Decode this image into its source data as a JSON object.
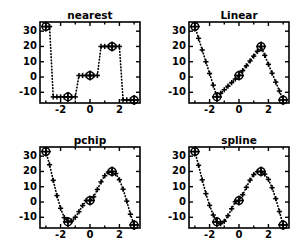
{
  "figure": {
    "width": 300,
    "height": 250,
    "background": "#ffffff",
    "foreground": "#000000",
    "rows": 2,
    "cols": 2
  },
  "chart_data": [
    {
      "type": "line",
      "title": "nearest",
      "xlabel": "",
      "ylabel": "",
      "xlim": [
        -3.4,
        3.4
      ],
      "ylim": [
        -17,
        36
      ],
      "xticks": [
        -2,
        0,
        2
      ],
      "xticklabels": [
        "-2",
        "0",
        "2"
      ],
      "yticks": [
        -10,
        0,
        10,
        20,
        30
      ],
      "yticklabels": [
        "-10",
        "0",
        "10",
        "20",
        "30"
      ],
      "grid": false,
      "legend": null,
      "knots": {
        "name": "sample points",
        "marker": "circle-plus",
        "x": [
          -3,
          -1.5,
          0,
          1.5,
          3
        ],
        "y": [
          33,
          -13,
          1,
          20,
          -15
        ]
      },
      "series": [
        {
          "name": "nearest",
          "marker": "plus",
          "linestyle": "dotted",
          "x": [
            -3,
            -2.75,
            -2.5,
            -2.25,
            -2,
            -1.75,
            -1.5,
            -1.25,
            -1,
            -0.75,
            -0.5,
            -0.25,
            0,
            0.25,
            0.5,
            0.75,
            1,
            1.25,
            1.5,
            1.75,
            2,
            2.25,
            2.5,
            2.75,
            3
          ],
          "y": [
            33,
            33,
            -13,
            -13,
            -13,
            -13,
            -13,
            -13,
            -13,
            1,
            1,
            1,
            1,
            1,
            1,
            20,
            20,
            20,
            20,
            20,
            20,
            -15,
            -15,
            -15,
            -15
          ]
        }
      ]
    },
    {
      "type": "line",
      "title": "Linear",
      "xlabel": "",
      "ylabel": "",
      "xlim": [
        -3.4,
        3.4
      ],
      "ylim": [
        -17,
        36
      ],
      "xticks": [
        -2,
        0,
        2
      ],
      "xticklabels": [
        "-2",
        "0",
        "2"
      ],
      "yticks": [
        -10,
        0,
        10,
        20,
        30
      ],
      "yticklabels": [
        "-10",
        "0",
        "10",
        "20",
        "30"
      ],
      "grid": false,
      "legend": null,
      "knots": {
        "name": "sample points",
        "marker": "circle-plus",
        "x": [
          -3,
          -1.5,
          0,
          1.5,
          3
        ],
        "y": [
          33,
          -13,
          1,
          20,
          -15
        ]
      },
      "series": [
        {
          "name": "linear",
          "marker": "plus",
          "linestyle": "dotted",
          "x": [
            -3,
            -2.75,
            -2.5,
            -2.25,
            -2,
            -1.75,
            -1.5,
            -1.25,
            -1,
            -0.75,
            -0.5,
            -0.25,
            0,
            0.25,
            0.5,
            0.75,
            1,
            1.25,
            1.5,
            1.75,
            2,
            2.25,
            2.5,
            2.75,
            3
          ],
          "y": [
            33,
            25.33,
            17.67,
            10,
            2.33,
            -5.33,
            -13,
            -10.67,
            -8.33,
            -6,
            -3.67,
            -1.33,
            1,
            4.17,
            7.33,
            10.5,
            13.67,
            16.83,
            20,
            14.17,
            8.33,
            2.5,
            -3.33,
            -9.17,
            -15
          ]
        }
      ]
    },
    {
      "type": "line",
      "title": "pchip",
      "xlabel": "",
      "ylabel": "",
      "xlim": [
        -3.4,
        3.4
      ],
      "ylim": [
        -17,
        36
      ],
      "xticks": [
        -2,
        0,
        2
      ],
      "xticklabels": [
        "-2",
        "0",
        "2"
      ],
      "yticks": [
        -10,
        0,
        10,
        20,
        30
      ],
      "yticklabels": [
        "-10",
        "0",
        "10",
        "20",
        "30"
      ],
      "grid": false,
      "legend": null,
      "knots": {
        "name": "sample points",
        "marker": "circle-plus",
        "x": [
          -3,
          -1.5,
          0,
          1.5,
          3
        ],
        "y": [
          33,
          -13,
          1,
          20,
          -15
        ]
      },
      "series": [
        {
          "name": "pchip",
          "marker": "plus",
          "linestyle": "dotted",
          "x": [
            -3,
            -2.75,
            -2.5,
            -2.25,
            -2,
            -1.75,
            -1.5,
            -1.25,
            -1,
            -0.75,
            -0.5,
            -0.25,
            0,
            0.25,
            0.5,
            0.75,
            1,
            1.25,
            1.5,
            1.75,
            2,
            2.25,
            2.5,
            2.75,
            3
          ],
          "y": [
            33,
            24.4,
            14.2,
            4.2,
            -4.1,
            -10.2,
            -13,
            -12.4,
            -10.0,
            -6.3,
            -2.3,
            1.0,
            1.0,
            3.4,
            8.2,
            13.2,
            17.2,
            19.6,
            20,
            18.6,
            14.6,
            8.4,
            0.6,
            -8.0,
            -15
          ]
        }
      ]
    },
    {
      "type": "line",
      "title": "spline",
      "xlabel": "",
      "ylabel": "",
      "xlim": [
        -3.4,
        3.4
      ],
      "ylim": [
        -17,
        36
      ],
      "xticks": [
        -2,
        0,
        2
      ],
      "xticklabels": [
        "-2",
        "0",
        "2"
      ],
      "yticks": [
        -10,
        0,
        10,
        20,
        30
      ],
      "yticklabels": [
        "-10",
        "0",
        "10",
        "20",
        "30"
      ],
      "grid": false,
      "legend": null,
      "knots": {
        "name": "sample points",
        "marker": "circle-plus",
        "x": [
          -3,
          -1.5,
          0,
          1.5,
          3
        ],
        "y": [
          33,
          -13,
          1,
          20,
          -15
        ]
      },
      "series": [
        {
          "name": "spline",
          "marker": "plus",
          "linestyle": "dotted",
          "x": [
            -3,
            -2.75,
            -2.5,
            -2.25,
            -2,
            -1.75,
            -1.5,
            -1.25,
            -1,
            -0.75,
            -0.5,
            -0.25,
            0,
            0.25,
            0.5,
            0.75,
            1,
            1.25,
            1.5,
            1.75,
            2,
            2.25,
            2.5,
            2.75,
            3
          ],
          "y": [
            33,
            24.0,
            14.5,
            5.5,
            -2.2,
            -8.5,
            -13,
            -14.2,
            -12.6,
            -9.0,
            -4.4,
            0.2,
            1.0,
            4.8,
            9.6,
            14.3,
            17.9,
            19.9,
            20,
            18.3,
            14.8,
            9.4,
            2.2,
            -6.2,
            -15
          ]
        }
      ]
    }
  ],
  "panels": [
    {
      "id": "panel-nearest",
      "title": "nearest",
      "row": 0,
      "col": 0
    },
    {
      "id": "panel-linear",
      "title": "Linear",
      "row": 0,
      "col": 1
    },
    {
      "id": "panel-pchip",
      "title": "pchip",
      "row": 1,
      "col": 0
    },
    {
      "id": "panel-spline",
      "title": "spline",
      "row": 1,
      "col": 1
    }
  ],
  "layout": {
    "panel_boxes": [
      {
        "left": 40,
        "top": 22,
        "width": 100,
        "height": 81
      },
      {
        "left": 189,
        "top": 22,
        "width": 100,
        "height": 81
      },
      {
        "left": 40,
        "top": 147,
        "width": 100,
        "height": 81
      },
      {
        "left": 189,
        "top": 147,
        "width": 100,
        "height": 81
      }
    ]
  }
}
